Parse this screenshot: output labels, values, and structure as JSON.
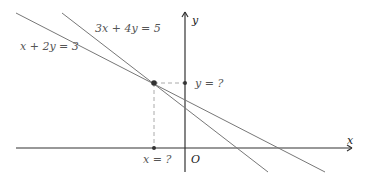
{
  "diagram": {
    "colors": {
      "line": "#777777",
      "axis": "#333333",
      "dashed": "#aaaaaa",
      "point": "#333333",
      "label": "#555555"
    },
    "axes": {
      "x_label": "x",
      "y_label": "y",
      "origin_label": "O"
    },
    "lines": [
      {
        "equation": "3x + 4y = 5"
      },
      {
        "equation": "x + 2y = 3"
      }
    ],
    "intersection": {
      "x_label": "x = ?",
      "y_label": "y = ?"
    }
  }
}
